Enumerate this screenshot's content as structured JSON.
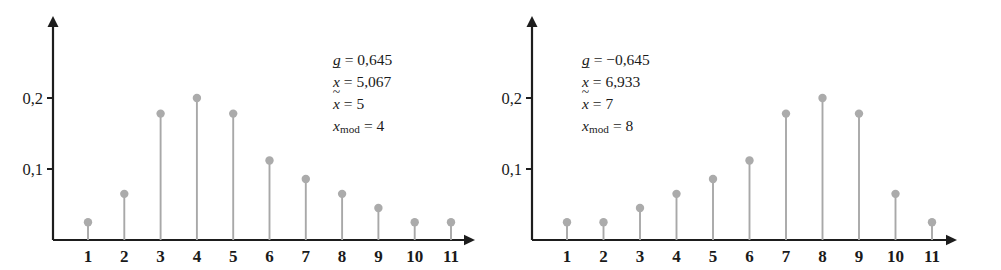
{
  "figure": {
    "background": "#ffffff",
    "axis_color": "#1d1d1d",
    "stem_color": "#a8a8a8",
    "marker_color": "#ababab",
    "text_color": "#1a1a1a"
  },
  "chart_data": [
    {
      "type": "bar",
      "title": "",
      "subtitle": "",
      "xlabel": "",
      "ylabel": "",
      "grid": false,
      "legend": "none",
      "axis_style": "arrow-ended stem (needle) plot",
      "categories": [
        "1",
        "2",
        "3",
        "4",
        "5",
        "6",
        "7",
        "8",
        "9",
        "10",
        "11"
      ],
      "x": [
        1,
        2,
        3,
        4,
        5,
        6,
        7,
        8,
        9,
        10,
        11
      ],
      "values": [
        0.025,
        0.065,
        0.178,
        0.2,
        0.178,
        0.112,
        0.086,
        0.065,
        0.045,
        0.025,
        0.025
      ],
      "xlim": [
        0,
        12
      ],
      "ylim": [
        0,
        0.26
      ],
      "ytick_values": [
        0.1,
        0.2
      ],
      "ytick_labels": [
        "0,1",
        "0,2"
      ],
      "xtick_labels": [
        "1",
        "2",
        "3",
        "4",
        "5",
        "6",
        "7",
        "8",
        "9",
        "10",
        "11"
      ],
      "annotations": [
        {
          "symbol": "g",
          "symbol_kind": "plain",
          "relation": "=",
          "value": "0,645"
        },
        {
          "symbol": "x",
          "symbol_kind": "overbar",
          "relation": "=",
          "value": "5,067"
        },
        {
          "symbol": "x",
          "symbol_kind": "tilde",
          "relation": "=",
          "value": "5"
        },
        {
          "symbol": "x",
          "symbol_kind": "subscript",
          "subscript": "mod",
          "relation": "=",
          "value": "4"
        }
      ]
    },
    {
      "type": "bar",
      "title": "",
      "subtitle": "",
      "xlabel": "",
      "ylabel": "",
      "grid": false,
      "legend": "none",
      "axis_style": "arrow-ended stem (needle) plot",
      "categories": [
        "1",
        "2",
        "3",
        "4",
        "5",
        "6",
        "7",
        "8",
        "9",
        "10",
        "11"
      ],
      "x": [
        1,
        2,
        3,
        4,
        5,
        6,
        7,
        8,
        9,
        10,
        11
      ],
      "values": [
        0.025,
        0.025,
        0.045,
        0.065,
        0.086,
        0.112,
        0.178,
        0.2,
        0.178,
        0.065,
        0.025
      ],
      "xlim": [
        0,
        12
      ],
      "ylim": [
        0,
        0.26
      ],
      "ytick_values": [
        0.1,
        0.2
      ],
      "ytick_labels": [
        "0,1",
        "0,2"
      ],
      "xtick_labels": [
        "1",
        "2",
        "3",
        "4",
        "5",
        "6",
        "7",
        "8",
        "9",
        "10",
        "11"
      ],
      "annotations": [
        {
          "symbol": "g",
          "symbol_kind": "plain",
          "relation": "=",
          "value": "−0,645"
        },
        {
          "symbol": "x",
          "symbol_kind": "overbar",
          "relation": "=",
          "value": "6,933"
        },
        {
          "symbol": "x",
          "symbol_kind": "tilde",
          "relation": "=",
          "value": "7"
        },
        {
          "symbol": "x",
          "symbol_kind": "subscript",
          "subscript": "mod",
          "relation": "=",
          "value": "8"
        }
      ]
    }
  ],
  "panels": {
    "left": {
      "stats": {
        "line1_value": "0,645",
        "line2_value": "5,067",
        "line3_value": "5",
        "line4_value": "4",
        "g_symbol": "g",
        "x_symbol": "x",
        "mod_subscript": "mod",
        "equals": "=",
        "overbar": "¯",
        "tilde": "~"
      },
      "ytick_labels": [
        "0,2",
        "0,1"
      ],
      "xtick_labels": [
        "1",
        "2",
        "3",
        "4",
        "5",
        "6",
        "7",
        "8",
        "9",
        "10",
        "11"
      ]
    },
    "right": {
      "stats": {
        "line1_value": "−0,645",
        "line2_value": "6,933",
        "line3_value": "7",
        "line4_value": "8",
        "g_symbol": "g",
        "x_symbol": "x",
        "mod_subscript": "mod",
        "equals": "=",
        "overbar": "¯",
        "tilde": "~"
      },
      "ytick_labels": [
        "0,2",
        "0,1"
      ],
      "xtick_labels": [
        "1",
        "2",
        "3",
        "4",
        "5",
        "6",
        "7",
        "8",
        "9",
        "10",
        "11"
      ]
    }
  }
}
